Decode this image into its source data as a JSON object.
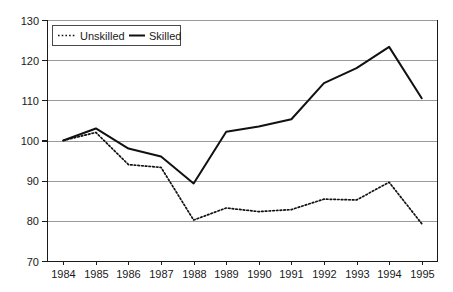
{
  "chart_data": {
    "type": "line",
    "title": "",
    "xlabel": "",
    "ylabel": "",
    "categories": [
      "1984",
      "1985",
      "1986",
      "1987",
      "1988",
      "1989",
      "1990",
      "1991",
      "1992",
      "1993",
      "1994",
      "1995"
    ],
    "series": [
      {
        "name": "Unskilled",
        "style": "dotted",
        "color": "#111111",
        "values": [
          100,
          102,
          94,
          93.3,
          80.2,
          83.2,
          82.3,
          82.8,
          85.4,
          85.2,
          89.6,
          79.3
        ]
      },
      {
        "name": "Skilled",
        "style": "solid",
        "color": "#111111",
        "values": [
          100,
          103,
          98,
          96,
          89.3,
          102.2,
          103.5,
          105.3,
          114.3,
          118,
          123.3,
          110.5
        ]
      }
    ],
    "ylim": [
      70,
      130
    ],
    "yticks": [
      70,
      80,
      90,
      100,
      110,
      120,
      130
    ],
    "ytick_labels": [
      "70",
      "80",
      "90",
      "100",
      "110",
      "120",
      "130"
    ],
    "xtick_labels": [
      "1984",
      "1985",
      "1986",
      "1987",
      "1988",
      "1989",
      "1990",
      "1991",
      "1992",
      "1993",
      "1994",
      "1995"
    ],
    "grid": true,
    "grid_axis": "y",
    "legend_position": "top-left",
    "legend_entries": [
      "Unskilled",
      "Skilled"
    ]
  },
  "legend": {
    "unskilled_label": "Unskilled",
    "skilled_label": "Skilled"
  },
  "axes": {
    "y_labels": [
      "130",
      "120",
      "110",
      "100",
      "90",
      "80",
      "70"
    ],
    "x_labels": [
      "1984",
      "1985",
      "1986",
      "1987",
      "1988",
      "1989",
      "1990",
      "1991",
      "1992",
      "1993",
      "1994",
      "1995"
    ]
  },
  "colors": {
    "line": "#111111",
    "grid": "#9a9a9a",
    "axis": "#1a1a1a",
    "background": "#ffffff"
  }
}
